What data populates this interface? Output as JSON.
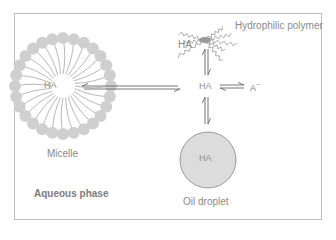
{
  "diagram": {
    "region_label": "Aqueous phase",
    "center_species": "HA",
    "conjugate_base": "A",
    "conjugate_base_charge": "−",
    "micelle": {
      "label": "Micelle",
      "core_species": "HA"
    },
    "polymer": {
      "label": "Hydrophilic polymer",
      "bound_species": "HA"
    },
    "oil_droplet": {
      "label": "Oil droplet",
      "core_species": "HA"
    },
    "colors": {
      "frame": "#bdbdbd",
      "bead": "#cfcfcf",
      "text": "#8a8a8a",
      "arrow": "#666666",
      "droplet_fill": "#dcdcdc",
      "droplet_stroke": "#9a9a9a"
    },
    "equilibria": [
      {
        "from": "HA (micelle)",
        "to": "HA (aqueous)",
        "type": "reversible"
      },
      {
        "from": "HA (polymer)",
        "to": "HA (aqueous)",
        "type": "reversible"
      },
      {
        "from": "HA (aqueous)",
        "to": "A-",
        "type": "reversible"
      },
      {
        "from": "HA (aqueous)",
        "to": "HA (oil droplet)",
        "type": "reversible"
      }
    ]
  }
}
